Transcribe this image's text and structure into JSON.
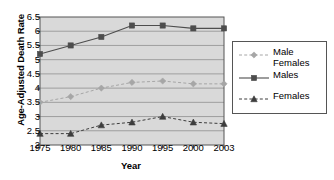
{
  "chart_data": {
    "type": "line",
    "title": "",
    "xlabel": "Year",
    "ylabel": "Age-Adjusted Death Rate",
    "categories": [
      1975,
      1980,
      1985,
      1990,
      1995,
      2000,
      2003
    ],
    "xtick_labels": [
      "1975",
      "1980",
      "1985",
      "1990",
      "1995",
      "2000",
      "2003"
    ],
    "ytick_labels": [
      "6.5",
      "6",
      "5.5",
      "5",
      "4.5",
      "4",
      "3.5",
      "3",
      "2.5",
      "2"
    ],
    "ylim": [
      2,
      6.5
    ],
    "xlim": [
      1975,
      2003
    ],
    "grid": "horizontal",
    "legend_position": "right",
    "plot_background": "#d9d9d9",
    "gridline_color": "#8f8f8f",
    "series": [
      {
        "name": "Male Females",
        "legend_label_line1": "Male",
        "legend_label_line2": "Females",
        "color": "#a6a6a6",
        "marker": "diamond",
        "linestyle": "dashed",
        "values": [
          3.5,
          3.7,
          4.0,
          4.2,
          4.25,
          4.15,
          4.15
        ]
      },
      {
        "name": "Males",
        "legend_label_line1": "Males",
        "legend_label_line2": "",
        "color": "#4d4d4d",
        "marker": "square",
        "linestyle": "solid",
        "values": [
          5.2,
          5.5,
          5.8,
          6.2,
          6.2,
          6.1,
          6.1
        ]
      },
      {
        "name": "Females",
        "legend_label_line1": "Females",
        "legend_label_line2": "",
        "color": "#3d3d3d",
        "marker": "triangle",
        "linestyle": "dashed",
        "values": [
          2.4,
          2.4,
          2.7,
          2.8,
          3.0,
          2.8,
          2.75
        ]
      }
    ]
  }
}
